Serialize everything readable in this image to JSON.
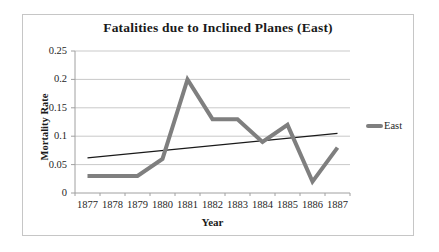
{
  "chart_data": {
    "type": "line",
    "title": "Fatalities due to Inclined Planes (East)",
    "xlabel": "Year",
    "ylabel": "Mortality Rate",
    "categories": [
      "1877",
      "1878",
      "1879",
      "1880",
      "1881",
      "1882",
      "1883",
      "1884",
      "1885",
      "1886",
      "1887"
    ],
    "series": [
      {
        "name": "East",
        "values": [
          0.03,
          0.03,
          0.03,
          0.06,
          0.2,
          0.13,
          0.13,
          0.09,
          0.12,
          0.02,
          0.08
        ],
        "color": "#7f7f7f",
        "line_width": 4
      }
    ],
    "trendline": {
      "type": "linear",
      "start_value": 0.062,
      "end_value": 0.105,
      "color": "#1a1a1a"
    },
    "ylim": [
      0,
      0.25
    ],
    "yticks": [
      {
        "label": "0.25",
        "value": 0.25
      },
      {
        "label": "0.2",
        "value": 0.2
      },
      {
        "label": "0.15",
        "value": 0.15
      },
      {
        "label": "0.1",
        "value": 0.1
      },
      {
        "label": "0.05",
        "value": 0.05
      },
      {
        "label": "0",
        "value": 0
      }
    ],
    "grid": true,
    "legend": {
      "label": "East",
      "position": "right"
    },
    "colors": {
      "gridline": "#c9c9c9",
      "axis": "#a0a0a0",
      "frame_border": "#c6c6c6",
      "text": "#1a1a1a",
      "background": "#ffffff"
    }
  }
}
